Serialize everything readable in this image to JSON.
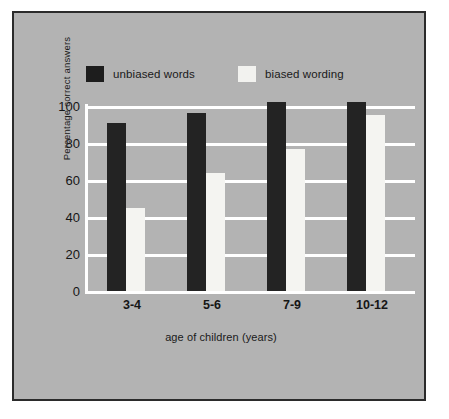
{
  "chart_data": {
    "type": "bar",
    "title": "",
    "subtitle": "",
    "xlabel": "age of children (years)",
    "ylabel": "Percentage correct answers",
    "categories": [
      "3-4",
      "5-6",
      "7-9",
      "10-12"
    ],
    "series": [
      {
        "name": "unbiased words",
        "color": "#232323",
        "values": [
          91,
          96,
          102,
          102
        ]
      },
      {
        "name": "biased wording",
        "color": "#f4f4f1",
        "values": [
          45,
          64,
          77,
          95
        ]
      }
    ],
    "ylim": [
      0,
      100
    ],
    "yticks": [
      0,
      20,
      40,
      60,
      80,
      100
    ],
    "ytick_labels": [
      "0",
      "20",
      "40",
      "60",
      "80",
      "100"
    ],
    "grid": true,
    "grid_color": "#ffffff",
    "axis_color": "#ffffff",
    "legend_position": "top",
    "background_color": "#b3b3b3",
    "frame_color": "#2b2b2b",
    "page_background": "#ffffff"
  },
  "legend": {
    "entries": [
      {
        "label": "unbiased words",
        "swatch": "dark-swatch-icon"
      },
      {
        "label": "biased wording",
        "swatch": "light-swatch-icon"
      }
    ]
  },
  "axes": {
    "y_title": "Percentage correct answers",
    "x_title": "age of children (years)",
    "y_tick_labels": [
      "100",
      "80",
      "60",
      "40",
      "20",
      "0"
    ],
    "x_tick_labels": [
      "3-4",
      "5-6",
      "7-9",
      "10-12"
    ]
  }
}
